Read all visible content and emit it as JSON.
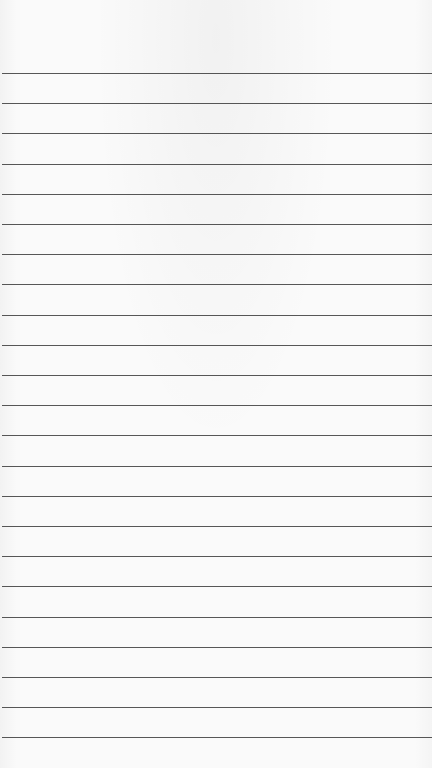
{
  "page": {
    "type": "lined-paper",
    "background_color": "#fafafa",
    "line_color": "#3a3a3a",
    "line_count": 23,
    "first_line_y": 73,
    "line_spacing_px": 30.2
  }
}
